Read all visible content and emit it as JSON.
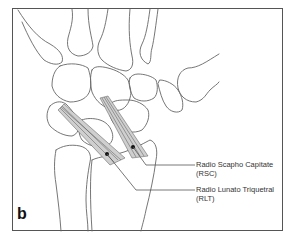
{
  "figure": {
    "panel_label": "b"
  },
  "labels": [
    {
      "name": "Radio Scapho Capitate",
      "abbr": "(RSC)"
    },
    {
      "name": "Radio Lunato Triquetral",
      "abbr": "(RLT)"
    }
  ],
  "colors": {
    "outline": "#555555",
    "ligament": "#666666",
    "frame": "#555555",
    "background": "#ffffff"
  }
}
